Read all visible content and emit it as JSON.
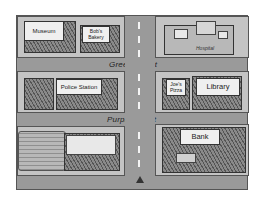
{
  "map": {
    "streets": {
      "horizontal": [
        {
          "name": "Green Street"
        },
        {
          "name": "Purple Street"
        }
      ]
    },
    "buildings": {
      "museum": "Museum",
      "bobs_bakery": "Bob's Bakery",
      "hospital": "Hospital",
      "police_station": "Police Station",
      "joes_pizza": "Joe's Pizza",
      "library": "Library",
      "bank": "Bank"
    },
    "marker": {
      "type": "triangle",
      "icon": "you-are-here-icon"
    },
    "colors": {
      "road": "#9a9a9a",
      "block": "#c4c4c4",
      "sign": "#efefef",
      "outline": "#333333"
    }
  }
}
